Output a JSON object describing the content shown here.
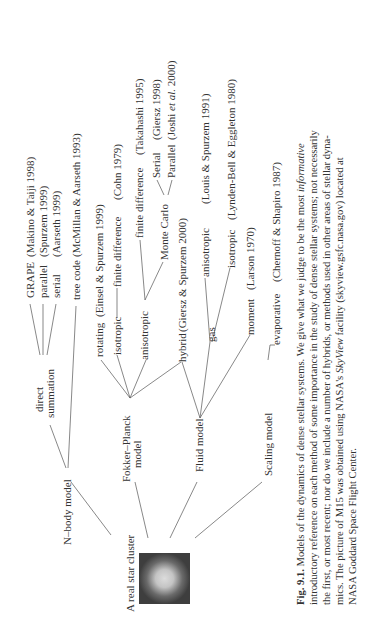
{
  "root": {
    "label": "A real star cluster",
    "image": "star-cluster-m15"
  },
  "models": [
    {
      "key": "nbody",
      "label": "N–body model"
    },
    {
      "key": "fokker",
      "label_line1": "Fokker–Planck",
      "label_line2": "model"
    },
    {
      "key": "fluid",
      "label": "Fluid model"
    },
    {
      "key": "scaling",
      "label": "Scaling model"
    }
  ],
  "nbody": {
    "direct_line1": "direct",
    "direct_line2": "summation",
    "grape": "GRAPE",
    "grape_ref": "(Makino & Taiji 1998)",
    "parallel": "parallel",
    "parallel_ref": "(Spurzem 1999)",
    "serial": "serial",
    "serial_ref": "(Aarseth 1999)",
    "tree": "tree  code",
    "tree_ref": "(McMillan & Aarseth 1993)"
  },
  "fokker": {
    "rotating": "rotating",
    "rotating_ref": "(Einsel & Spurzem  1999)",
    "isotropic": "isotropic",
    "iso_fd": "finite difference",
    "iso_fd_ref": "(Cohn 1979)",
    "anisotropic": "anisotropic",
    "aniso_fd": "finite difference",
    "aniso_fd_ref": "(Takahashi 1995)",
    "monte_carlo": "Monte Carlo",
    "mc_serial": "Serial",
    "mc_serial_ref": "(Giersz 1998)",
    "mc_parallel": "Parallel",
    "mc_parallel_ref_a": "(Joshi ",
    "mc_parallel_ref_b": "et al.",
    "mc_parallel_ref_c": " 2000)"
  },
  "fluid": {
    "hybrid": "hybrid",
    "hybrid_ref": "(Giersz & Spurzem 2000)",
    "gas": "gas",
    "gas_aniso": "anisotropic",
    "gas_aniso_ref": "(Louis & Spurzem 1991)",
    "gas_iso": "isotropic",
    "gas_iso_ref": "(Lynden-Bell & Eggleton 1980)",
    "moment": "moment",
    "moment_ref": "(Larson 1970)"
  },
  "scaling": {
    "evaporative": "evaporative",
    "evaporative_ref": "(Chernoff & Shapiro 1987)"
  },
  "caption": {
    "fig_label": "Fig. 9.1.",
    "line1_a": " Models of the dynamics of dense stellar systems. We give what we judge to be the most ",
    "line1_b": "informative",
    "line2": "introductory reference on each method of some importance in the study of dense stellar systems; not necessarily",
    "line3": "the first, or most recent; nor do we include a number of hybrids, or methods used in other areas of stellar dyna-",
    "line4_a": "mics. The picture of M15 was obtained using NASA's ",
    "line4_b": "SkyView",
    "line4_c": " facility (skyview.gsfc.nasa.gov) located at",
    "line5": "NASA Goddard Space Flight Center."
  },
  "colors": {
    "text": "#333333",
    "lines": "#555555",
    "background": "#ffffff"
  }
}
